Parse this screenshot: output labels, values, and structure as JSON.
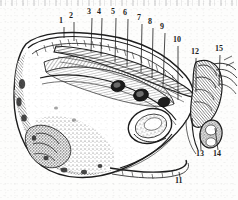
{
  "figure": {
    "kind": "anatomical-engraving",
    "style": "black-and-white stipple / hatch line engraving on aged paper",
    "background_color": "#fdfdfc",
    "ink_color": "#1d1d1d",
    "has_scanner_noise_strip": true
  },
  "labels": [
    {
      "id": "1",
      "text": "1",
      "x": 62,
      "y": 24,
      "leader_to_x": 64,
      "leader_to_y": 38
    },
    {
      "id": "2",
      "text": "2",
      "x": 72,
      "y": 19,
      "leader_to_x": 74,
      "leader_to_y": 41
    },
    {
      "id": "3",
      "text": "3",
      "x": 90,
      "y": 15,
      "leader_to_x": 91,
      "leader_to_y": 52
    },
    {
      "id": "4",
      "text": "4",
      "x": 100,
      "y": 15,
      "leader_to_x": 101,
      "leader_to_y": 56
    },
    {
      "id": "5",
      "text": "5",
      "x": 114,
      "y": 15,
      "leader_to_x": 115,
      "leader_to_y": 62
    },
    {
      "id": "6",
      "text": "6",
      "x": 126,
      "y": 16,
      "leader_to_x": 127,
      "leader_to_y": 66
    },
    {
      "id": "7",
      "text": "7",
      "x": 140,
      "y": 21,
      "leader_to_x": 141,
      "leader_to_y": 72
    },
    {
      "id": "8",
      "text": "8",
      "x": 151,
      "y": 25,
      "leader_to_x": 152,
      "leader_to_y": 78
    },
    {
      "id": "9",
      "text": "9",
      "x": 163,
      "y": 30,
      "leader_to_x": 163,
      "leader_to_y": 86
    },
    {
      "id": "10",
      "text": "10",
      "x": 176,
      "y": 43,
      "leader_to_x": 178,
      "leader_to_y": 100
    },
    {
      "id": "11",
      "text": "11",
      "x": 178,
      "y": 184,
      "leader_to_x": 179,
      "leader_to_y": 172
    },
    {
      "id": "12",
      "text": "12",
      "x": 194,
      "y": 55,
      "leader_to_x": 196,
      "leader_to_y": 92
    },
    {
      "id": "13",
      "text": "13",
      "x": 199,
      "y": 157,
      "leader_to_x": 200,
      "leader_to_y": 133
    },
    {
      "id": "14",
      "text": "14",
      "x": 216,
      "y": 157,
      "leader_to_x": 215,
      "leader_to_y": 128
    },
    {
      "id": "15",
      "text": "15",
      "x": 218,
      "y": 52,
      "leader_to_x": 219,
      "leader_to_y": 86
    }
  ],
  "label_count": 15
}
